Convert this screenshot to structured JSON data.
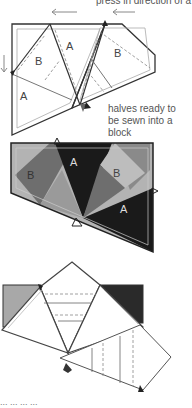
{
  "captions": {
    "top": "press in direction of a",
    "middle": "halves ready to be sewn into a block",
    "bottom": "... ... ... ..."
  },
  "diagram1": {
    "labels": [
      "A",
      "B",
      "A",
      "B"
    ],
    "description": "two quilt block halves with seam allowances, pressing arrows"
  },
  "diagram2": {
    "labels": [
      "A",
      "B",
      "B",
      "A"
    ],
    "description": "shaded block halves showing fabric placement"
  },
  "diagram3": {
    "description": "folded block with dashed seam lines"
  },
  "colors": {
    "line": "#333333",
    "light_line": "#999999",
    "fabric_dark": "#1a1a1a",
    "fabric_mid": "#6e6e6e",
    "fabric_light": "#b3b3b3"
  }
}
